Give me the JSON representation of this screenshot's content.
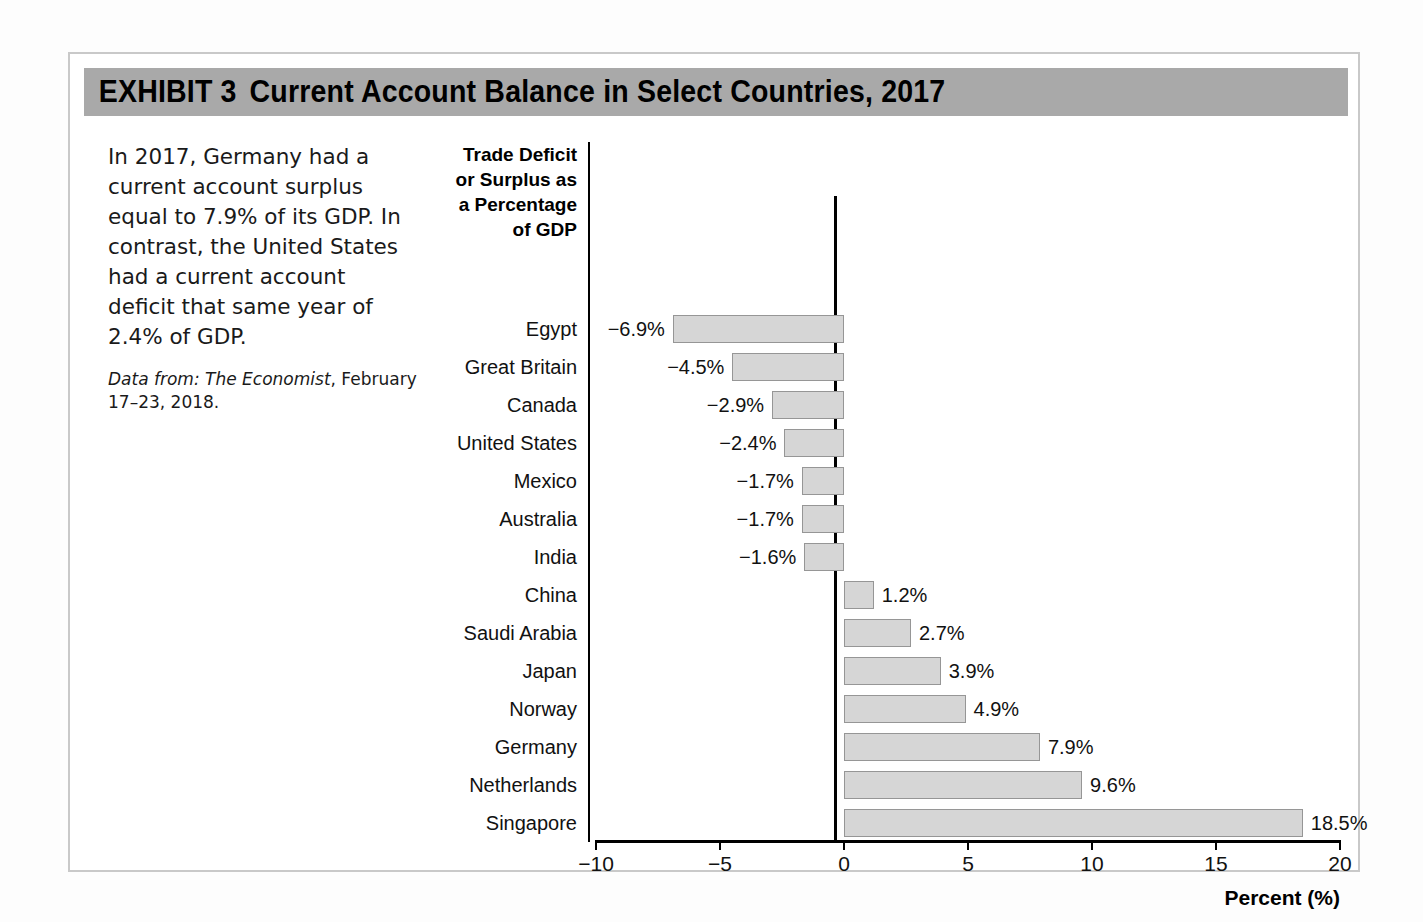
{
  "exhibit": {
    "label": "EXHIBIT 3",
    "title": "Current Account Balance in Select Countries, 2017",
    "header_bg": "#a9a9a9"
  },
  "caption": {
    "body": "In 2017, Germany had a current account surplus equal to 7.9% of its GDP. In contrast, the United States had a current account deficit that same year of 2.4% of GDP.",
    "source_lead": "Data from: The Economist",
    "source_rest": ", February 17–23, 2018."
  },
  "chart_data": {
    "type": "bar",
    "orientation": "horizontal",
    "title": "Current Account Balance in Select Countries, 2017",
    "axis_title": "Trade Deficit or Surplus as a Percentage of GDP",
    "axis_title_lines": [
      "Trade Deficit",
      "or Surplus as",
      "a Percentage",
      "of GDP"
    ],
    "xlabel": "Percent (%)",
    "ylabel": "",
    "xlim": [
      -10,
      20
    ],
    "xticks": [
      -10,
      -5,
      0,
      5,
      10,
      15,
      20
    ],
    "xtick_labels": [
      "−10",
      "−5",
      "0",
      "5",
      "10",
      "15",
      "20"
    ],
    "grid": false,
    "legend": false,
    "bar_fill": "#d6d6d6",
    "bar_border": "#969696",
    "categories": [
      "Egypt",
      "Great Britain",
      "Canada",
      "United States",
      "Mexico",
      "Australia",
      "India",
      "China",
      "Saudi Arabia",
      "Japan",
      "Norway",
      "Germany",
      "Netherlands",
      "Singapore"
    ],
    "values": [
      -6.9,
      -4.5,
      -2.9,
      -2.4,
      -1.7,
      -1.7,
      -1.6,
      1.2,
      2.7,
      3.9,
      4.9,
      7.9,
      9.6,
      18.5
    ],
    "value_labels": [
      "−6.9%",
      "−4.5%",
      "−2.9%",
      "−2.4%",
      "−1.7%",
      "−1.7%",
      "−1.6%",
      "1.2%",
      "2.7%",
      "3.9%",
      "4.9%",
      "7.9%",
      "9.6%",
      "18.5%"
    ],
    "bars": [
      {
        "label": "Egypt",
        "value": -6.9,
        "value_label": "−6.9%"
      },
      {
        "label": "Great Britain",
        "value": -4.5,
        "value_label": "−4.5%"
      },
      {
        "label": "Canada",
        "value": -2.9,
        "value_label": "−2.9%"
      },
      {
        "label": "United States",
        "value": -2.4,
        "value_label": "−2.4%"
      },
      {
        "label": "Mexico",
        "value": -1.7,
        "value_label": "−1.7%"
      },
      {
        "label": "Australia",
        "value": -1.7,
        "value_label": "−1.7%"
      },
      {
        "label": "India",
        "value": -1.6,
        "value_label": "−1.6%"
      },
      {
        "label": "China",
        "value": 1.2,
        "value_label": "1.2%"
      },
      {
        "label": "Saudi Arabia",
        "value": 2.7,
        "value_label": "2.7%"
      },
      {
        "label": "Japan",
        "value": 3.9,
        "value_label": "3.9%"
      },
      {
        "label": "Norway",
        "value": 4.9,
        "value_label": "4.9%"
      },
      {
        "label": "Germany",
        "value": 7.9,
        "value_label": "7.9%"
      },
      {
        "label": "Netherlands",
        "value": 9.6,
        "value_label": "9.6%"
      },
      {
        "label": "Singapore",
        "value": 18.5,
        "value_label": "18.5%"
      }
    ]
  }
}
